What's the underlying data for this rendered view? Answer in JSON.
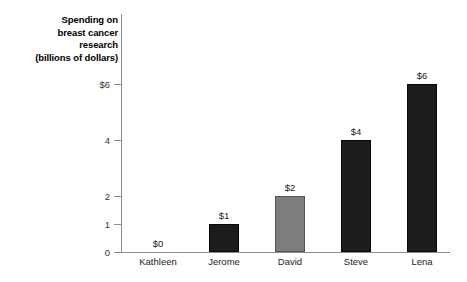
{
  "chart_data": {
    "type": "bar",
    "title": "Spending on\nbreast cancer\nresearch\n(billions of dollars)",
    "ylabel": "Spending on breast cancer research (billions of dollars)",
    "xlabel": "",
    "categories": [
      "Kathleen",
      "Jerome",
      "David",
      "Steve",
      "Lena"
    ],
    "values": [
      0,
      1,
      2,
      4,
      6
    ],
    "data_labels": [
      "$0",
      "$1",
      "$2",
      "$4",
      "$6"
    ],
    "bar_colors": [
      "#1c1c1c",
      "#1c1c1c",
      "#7d7d7d",
      "#1c1c1c",
      "#1c1c1c"
    ],
    "ylim": [
      0,
      6.4
    ],
    "yticks": [
      0,
      1,
      2,
      4,
      6
    ],
    "ytick_labels": [
      "0",
      "1",
      "2",
      "4",
      "$6"
    ],
    "grid": false,
    "legend": null,
    "axis_color": "#8d8d8d",
    "background": "#ffffff"
  },
  "axis": {
    "title_line1": "Spending on",
    "title_line2": "breast cancer",
    "title_line3": "research",
    "title_line4": "(billions of dollars)"
  }
}
